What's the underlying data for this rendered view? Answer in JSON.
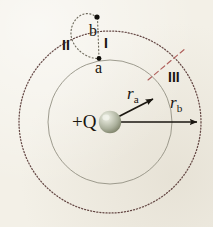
{
  "figure": {
    "background_color": "#f3f0e7",
    "width": 213,
    "height": 227
  },
  "charge": {
    "label": "+Q",
    "sign": "+",
    "symbol": "Q",
    "center": [
      110,
      122
    ],
    "radius": 11,
    "sphere_color": "#b9bdac",
    "highlight_color": "#e8eade"
  },
  "circles": [
    {
      "name": "inner-equipotential",
      "radius_label": "r_a",
      "radius_px": 62,
      "style": "solid",
      "color": "#8c8a7d"
    },
    {
      "name": "outer-equipotential",
      "radius_label": "r_b",
      "radius_px": 91,
      "style": "dotted",
      "color": "#5a3b39"
    }
  ],
  "points": [
    {
      "id": "point-a",
      "label": "a",
      "x": 99,
      "y": 59,
      "on": "inner-equipotential"
    },
    {
      "id": "point-b",
      "label": "b",
      "x": 97,
      "y": 17,
      "on": "outer-equipotential"
    }
  ],
  "paths": [
    {
      "id": "path-I",
      "label": "I",
      "style": "dotted",
      "color": "#6f6a5c",
      "description": "straight radial dotted path from b to a"
    },
    {
      "id": "path-II",
      "label": "II",
      "style": "dotted",
      "color": "#6f6a5c",
      "description": "curved dotted loop bulging left from b to a"
    },
    {
      "id": "path-III",
      "label": "III",
      "style": "dashed",
      "color": "#b05a58",
      "description": "red dashed radial path from inner circle outward to outer circle"
    }
  ],
  "vectors": [
    {
      "id": "vector-ra",
      "label_main": "r",
      "label_sub": "a",
      "from": [
        110,
        122
      ],
      "to": [
        158,
        97
      ],
      "color": "#1a1610"
    },
    {
      "id": "vector-rb",
      "label_main": "r",
      "label_sub": "b",
      "from": [
        110,
        122
      ],
      "to": [
        200,
        122
      ],
      "color": "#1a1610"
    }
  ],
  "labels": {
    "charge": "+Q",
    "point_a": "a",
    "point_b": "b",
    "path_I": "I",
    "path_II": "II",
    "path_III": "III",
    "r_a_main": "r",
    "r_a_sub": "a",
    "r_b_main": "r",
    "r_b_sub": "b"
  }
}
